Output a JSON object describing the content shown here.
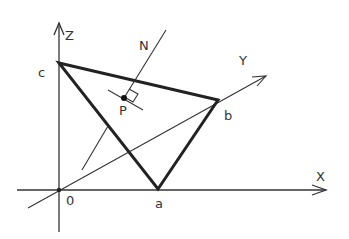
{
  "diagram": {
    "colors": {
      "stroke": "#222222",
      "background": "#ffffff"
    },
    "axes": {
      "x_label": "X",
      "y_label": "Y",
      "z_label": "Z",
      "origin_label": "0"
    },
    "points": {
      "a": "a",
      "b": "b",
      "c": "c",
      "p": "P"
    },
    "normal_label": "N"
  }
}
